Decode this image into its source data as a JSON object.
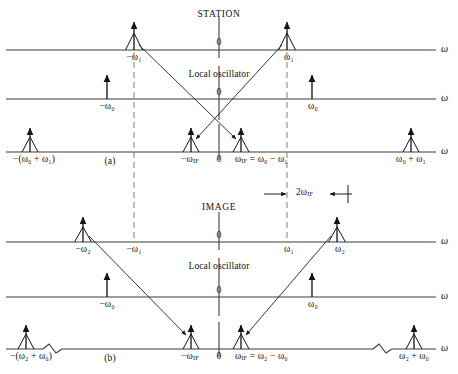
{
  "figure": {
    "type": "signal-spectrum-diagram",
    "panels": [
      {
        "key": "a",
        "panel_label": "(a)",
        "title": "STATION",
        "rows": [
          {
            "key": "input",
            "axis_label": "ω",
            "origin_label": "0",
            "impulses": [
              {
                "label": "−ω₁",
                "type": "delta"
              },
              {
                "label": "ω₁",
                "type": "delta"
              }
            ]
          },
          {
            "key": "local-oscillator",
            "caption": "Local oscillator",
            "axis_label": "ω",
            "origin_label": "0",
            "impulses": [
              {
                "label": "−ω₀",
                "type": "arrow"
              },
              {
                "label": "ω₀",
                "type": "arrow"
              }
            ]
          },
          {
            "key": "output",
            "axis_label": "ω",
            "origin_label": "0",
            "impulses": [
              {
                "label": "−(ω₀ + ω₁)",
                "type": "delta"
              },
              {
                "label": "−ω",
                "sub": "IF",
                "type": "delta"
              },
              {
                "label": "ω",
                "sub": "IF",
                "equation": "= ω₀ − ω₁",
                "type": "delta"
              },
              {
                "label": "ω₀ + ω₁",
                "type": "delta"
              }
            ]
          }
        ]
      },
      {
        "key": "b",
        "panel_label": "(b)",
        "title": "IMAGE",
        "rows": [
          {
            "key": "input",
            "axis_label": "ω",
            "origin_label": "0",
            "impulses": [
              {
                "label": "−ω₂",
                "type": "delta"
              },
              {
                "label": "ω₂",
                "type": "delta"
              }
            ],
            "ticks": [
              {
                "label": "−ω₁"
              },
              {
                "label": "ω₁"
              }
            ]
          },
          {
            "key": "local-oscillator",
            "caption": "Local oscillator",
            "axis_label": "ω",
            "origin_label": "0",
            "impulses": [
              {
                "label": "−ω₀",
                "type": "arrow"
              },
              {
                "label": "ω₀",
                "type": "arrow"
              }
            ]
          },
          {
            "key": "output",
            "axis_label": "ω",
            "origin_label": "0",
            "impulses": [
              {
                "label": "−(ω₂ + ω₀)",
                "type": "delta"
              },
              {
                "label": "−ω",
                "sub": "IF",
                "type": "delta"
              },
              {
                "label": "ω",
                "sub": "IF",
                "equation": "= ω₂ − ω₀",
                "type": "delta"
              },
              {
                "label": "ω₂ + ω₀",
                "type": "delta"
              }
            ]
          }
        ]
      }
    ],
    "annotations": [
      {
        "key": "bandwidth",
        "label": "2ω",
        "sub": "IF",
        "style": "dimension-arrows"
      }
    ],
    "colors": {
      "ink": "#1a1a1a",
      "axis": "#3a3a3a",
      "dashed": "#6b6b6b",
      "background": "#ffffff"
    }
  }
}
